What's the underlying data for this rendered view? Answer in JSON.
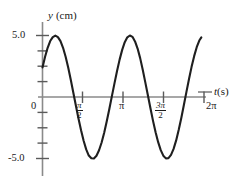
{
  "figure": {
    "name": "oscillation-displacement-vs-time-graph",
    "background_color": "#ffffff",
    "curve_color": "#1f1f1f",
    "axis_color": "#8a8a8a",
    "text_color": "#1a1a1a"
  },
  "axes": {
    "y_axis_label_symbol": "y",
    "y_axis_label_unit": "(cm)",
    "x_axis_label_symbol": "t",
    "x_axis_label_unit": "(s)",
    "origin_label": "0",
    "y_tick_labels": [
      "5.0",
      "-5.0"
    ],
    "y_tick_top": "5.0",
    "y_tick_bottom": "-5.0",
    "x_tick_labels": [
      {
        "id": "pi-over-2",
        "numerator": "π",
        "denominator": "2",
        "is_fraction": true
      },
      {
        "id": "pi",
        "text": "π",
        "is_fraction": false
      },
      {
        "id": "three-pi-over-2",
        "numerator": "3π",
        "denominator": "2",
        "is_fraction": true
      },
      {
        "id": "two-pi",
        "text": "2π",
        "is_fraction": false
      }
    ]
  },
  "chart_data": {
    "type": "line",
    "title": "",
    "xlabel": "t (s)",
    "ylabel": "y (cm)",
    "xlim": [
      0,
      6.6
    ],
    "ylim": [
      -6.6,
      6.6
    ],
    "grid": false,
    "legend": null,
    "function": "y = 5.0 sin(2t + 0.50)",
    "amplitude_cm": 5.0,
    "period_s": 3.1416,
    "angular_frequency_rad_per_s": 2.0,
    "phase_rad": 0.5,
    "y_at_t0_cm": 2.4,
    "x_ticks": [
      1.5708,
      3.1416,
      4.7124,
      6.2832
    ],
    "x_tick_text": [
      "π/2",
      "π",
      "3π/2",
      "2π"
    ],
    "y_ticks": [
      -5.0,
      -3.75,
      -2.5,
      -1.25,
      0,
      1.25,
      2.5,
      3.75,
      5.0
    ],
    "y_labeled_ticks": [
      5.0,
      -5.0
    ],
    "key_points": [
      {
        "label": "start",
        "t": 0.0,
        "y": 2.4
      },
      {
        "label": "first-maximum",
        "t": 0.535,
        "y": 5.0
      },
      {
        "label": "first-zero-descending",
        "t": 1.321,
        "y": 0.0
      },
      {
        "label": "first-minimum",
        "t": 2.106,
        "y": -5.0
      },
      {
        "label": "second-zero-ascending",
        "t": 2.892,
        "y": 0.0
      },
      {
        "label": "second-maximum",
        "t": 3.677,
        "y": 5.0
      },
      {
        "label": "third-zero-descending",
        "t": 4.462,
        "y": 0.0
      },
      {
        "label": "second-minimum",
        "t": 5.248,
        "y": -5.0
      },
      {
        "label": "fourth-zero-ascending",
        "t": 6.034,
        "y": 0.0
      },
      {
        "label": "end",
        "t": 6.18,
        "y": 2.6
      }
    ],
    "series": [
      {
        "name": "displacement",
        "x": [
          0.0,
          0.1,
          0.2,
          0.3,
          0.4,
          0.5,
          0.6,
          0.7,
          0.8,
          0.9,
          1.0,
          1.1,
          1.2,
          1.3,
          1.4,
          1.5,
          1.6,
          1.7,
          1.8,
          1.9,
          2.0,
          2.1,
          2.2,
          2.3,
          2.4,
          2.5,
          2.6,
          2.7,
          2.8,
          2.9,
          3.0,
          3.1,
          3.2,
          3.3,
          3.4,
          3.5,
          3.6,
          3.7,
          3.8,
          3.9,
          4.0,
          4.1,
          4.2,
          4.3,
          4.4,
          4.5,
          4.6,
          4.7,
          4.8,
          4.9,
          5.0,
          5.1,
          5.2,
          5.3,
          5.4,
          5.5,
          5.6,
          5.7,
          5.8,
          5.9,
          6.0,
          6.1,
          6.18
        ],
        "y": [
          2.4,
          3.27,
          4.0,
          4.55,
          4.87,
          4.99,
          4.87,
          4.54,
          4.0,
          3.27,
          2.4,
          1.41,
          0.35,
          -0.71,
          -1.75,
          -2.71,
          -3.56,
          -4.26,
          -4.76,
          -4.98,
          -5.0,
          -4.78,
          -4.33,
          -3.7,
          -2.9,
          -1.98,
          -0.98,
          0.07,
          1.11,
          2.12,
          3.04,
          3.83,
          4.46,
          4.85,
          5.0,
          4.89,
          4.52,
          3.94,
          3.16,
          2.22,
          1.19,
          0.14,
          -0.92,
          -1.94,
          -2.86,
          -3.67,
          -4.32,
          -4.77,
          -4.99,
          -4.97,
          -4.71,
          -4.22,
          -3.53,
          -2.67,
          -1.7,
          -0.65,
          0.42,
          1.46,
          2.45,
          3.32,
          4.05,
          4.59,
          4.85
        ]
      }
    ]
  }
}
